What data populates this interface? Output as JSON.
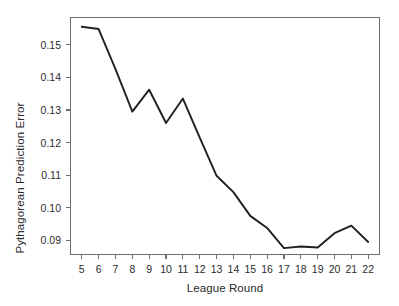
{
  "chart_data": {
    "type": "line",
    "title": "",
    "xlabel": "League Round",
    "ylabel": "Pythagorean Prediction Error",
    "x": [
      5,
      6,
      7,
      8,
      9,
      10,
      11,
      12,
      13,
      14,
      15,
      16,
      17,
      18,
      19,
      20,
      21,
      22
    ],
    "values": [
      0.1555,
      0.1548,
      0.1425,
      0.1295,
      0.1362,
      0.126,
      0.1335,
      0.1215,
      0.1098,
      0.1048,
      0.0975,
      0.0938,
      0.0876,
      0.0881,
      0.0878,
      0.0922,
      0.0945,
      0.0895
    ],
    "series": [
      {
        "name": "Pythagorean Prediction Error",
        "values": [
          0.1555,
          0.1548,
          0.1425,
          0.1295,
          0.1362,
          0.126,
          0.1335,
          0.1215,
          0.1098,
          0.1048,
          0.0975,
          0.0938,
          0.0876,
          0.0881,
          0.0878,
          0.0922,
          0.0945,
          0.0895
        ]
      }
    ],
    "xlim": [
      4.3,
      22.7
    ],
    "ylim": [
      0.0855,
      0.1585
    ],
    "x_tick_labels": [
      "5",
      "6",
      "7",
      "8",
      "9",
      "10",
      "11",
      "12",
      "13",
      "14",
      "15",
      "16",
      "17",
      "18",
      "19",
      "20",
      "21",
      "22"
    ],
    "x_ticks": [
      5,
      6,
      7,
      8,
      9,
      10,
      11,
      12,
      13,
      14,
      15,
      16,
      17,
      18,
      19,
      20,
      21,
      22
    ],
    "y_ticks": [
      0.09,
      0.1,
      0.11,
      0.12,
      0.13,
      0.14,
      0.15
    ],
    "y_tick_labels": [
      "0.09",
      "0.10",
      "0.11",
      "0.12",
      "0.13",
      "0.14",
      "0.15"
    ],
    "grid": false,
    "legend": null,
    "legend_position": "none",
    "line_color": "#231f20",
    "frame_color": "#6f6f70",
    "background_color": "#ffffff"
  }
}
